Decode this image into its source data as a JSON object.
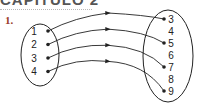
{
  "heading": {
    "text": "CAPÍTULO 2"
  },
  "exercise": {
    "number": "1.",
    "number_color": "#9a3b2a"
  },
  "diagram": {
    "type": "arrow-mapping",
    "line_color": "#222222",
    "domain": [
      "1",
      "2",
      "3",
      "4"
    ],
    "codomain": [
      "3",
      "4",
      "5",
      "6",
      "7",
      "8",
      "9"
    ],
    "mappings": [
      {
        "from": "1",
        "to": "3"
      },
      {
        "from": "2",
        "to": "5"
      },
      {
        "from": "3",
        "to": "7"
      },
      {
        "from": "4",
        "to": "9"
      }
    ]
  }
}
